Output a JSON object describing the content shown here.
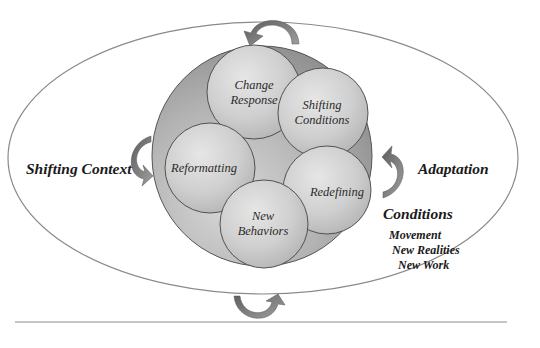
{
  "diagram": {
    "title": "",
    "outer_ellipse": {
      "stroke": "#8a8a8a"
    },
    "core_circle": {
      "fill": "#9a9a9a",
      "stroke": "#555555"
    },
    "inner_circles": [
      {
        "id": "change-response",
        "lines": [
          "Change",
          "Response"
        ]
      },
      {
        "id": "shifting-conditions",
        "lines": [
          "Shifting",
          "Conditions"
        ]
      },
      {
        "id": "reformatting",
        "lines": [
          "Reformatting"
        ]
      },
      {
        "id": "redefining",
        "lines": [
          "Redefining"
        ]
      },
      {
        "id": "new-behaviors",
        "lines": [
          "New",
          "Behaviors"
        ]
      }
    ],
    "left_label": "Shifting Context",
    "right_label": "Adaptation",
    "conditions": {
      "heading": "Conditions",
      "items": [
        "Movement",
        "New Realities",
        "New Work"
      ]
    },
    "arrows": {
      "top": "curved-arrow-down-left",
      "left": "curved-arrow-down",
      "right": "curved-arrow-up",
      "bottom": "curved-arrow-up-right",
      "color": "#6f6f6f"
    },
    "footer_rule_color": "#8c8c8c"
  }
}
